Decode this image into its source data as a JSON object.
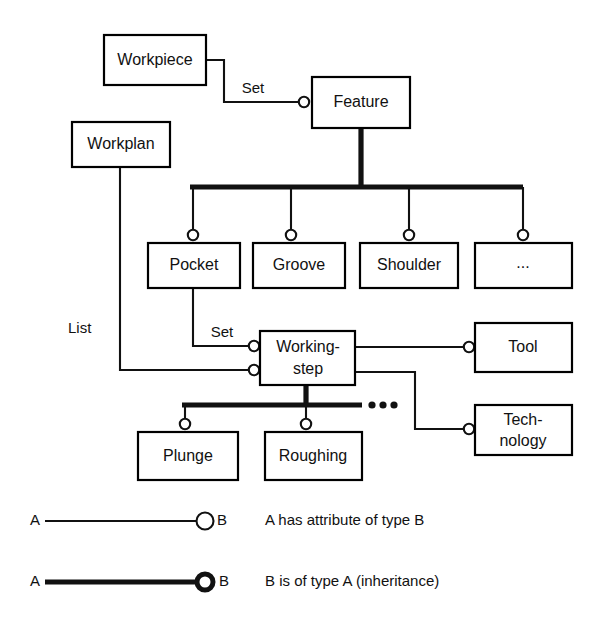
{
  "diagram": {
    "colors": {
      "line": "#111111",
      "box_fill": "#ffffff",
      "background": "#ffffff"
    },
    "nodes": [
      {
        "id": "workpiece",
        "label": "Workpiece",
        "x": 104,
        "y": 35,
        "w": 102,
        "h": 50
      },
      {
        "id": "feature",
        "label": "Feature",
        "x": 312,
        "y": 77,
        "w": 98,
        "h": 51
      },
      {
        "id": "workplan",
        "label": "Workplan",
        "x": 72,
        "y": 122,
        "w": 98,
        "h": 45
      },
      {
        "id": "pocket",
        "label": "Pocket",
        "x": 148,
        "y": 243,
        "w": 92,
        "h": 45
      },
      {
        "id": "groove",
        "label": "Groove",
        "x": 253,
        "y": 243,
        "w": 92,
        "h": 45
      },
      {
        "id": "shoulder",
        "label": "Shoulder",
        "x": 360,
        "y": 243,
        "w": 98,
        "h": 45
      },
      {
        "id": "more-feature",
        "label": "...",
        "x": 475,
        "y": 243,
        "w": 97,
        "h": 45
      },
      {
        "id": "workingstep",
        "label": "Working-step",
        "x": 260,
        "y": 331,
        "w": 95,
        "h": 54,
        "lines": [
          "Working-",
          "step"
        ]
      },
      {
        "id": "tool",
        "label": "Tool",
        "x": 475,
        "y": 323,
        "w": 97,
        "h": 49
      },
      {
        "id": "technology",
        "label": "Technology",
        "x": 475,
        "y": 405,
        "w": 97,
        "h": 50,
        "lines": [
          "Tech-",
          "nology"
        ]
      },
      {
        "id": "plunge",
        "label": "Plunge",
        "x": 138,
        "y": 432,
        "w": 100,
        "h": 48
      },
      {
        "id": "roughing",
        "label": "Roughing",
        "x": 265,
        "y": 432,
        "w": 97,
        "h": 48
      }
    ],
    "edge_labels": [
      {
        "id": "set-workpiece-feature",
        "text": "Set",
        "x": 253,
        "y": 89
      },
      {
        "id": "set-pocket-workingstep",
        "text": "Set",
        "x": 222,
        "y": 333
      },
      {
        "id": "list-workplan",
        "text": "List",
        "x": 68,
        "y": 329
      }
    ],
    "relations": [
      {
        "id": "workpiece-has-feature",
        "type": "attribute",
        "from": "Workpiece",
        "to": "Feature",
        "label": "Set"
      },
      {
        "id": "workplan-has-workingstep",
        "type": "attribute",
        "from": "Workplan",
        "to": "Working-step",
        "label": "List"
      },
      {
        "id": "pocket-has-workingstep",
        "type": "attribute",
        "from": "Pocket",
        "to": "Working-step",
        "label": "Set"
      },
      {
        "id": "workingstep-has-tool",
        "type": "attribute",
        "from": "Working-step",
        "to": "Tool",
        "label": ""
      },
      {
        "id": "workingstep-has-technology",
        "type": "attribute",
        "from": "Working-step",
        "to": "Technology",
        "label": ""
      },
      {
        "id": "feature-to-pocket",
        "type": "inheritance",
        "from": "Feature",
        "to": "Pocket",
        "label": ""
      },
      {
        "id": "feature-to-groove",
        "type": "inheritance",
        "from": "Feature",
        "to": "Groove",
        "label": ""
      },
      {
        "id": "feature-to-shoulder",
        "type": "inheritance",
        "from": "Feature",
        "to": "Shoulder",
        "label": ""
      },
      {
        "id": "feature-to-more",
        "type": "inheritance",
        "from": "Feature",
        "to": "...",
        "label": ""
      },
      {
        "id": "workingstep-to-plunge",
        "type": "inheritance",
        "from": "Working-step",
        "to": "Plunge",
        "label": ""
      },
      {
        "id": "workingstep-to-roughing",
        "type": "inheritance",
        "from": "Working-step",
        "to": "Roughing",
        "label": ""
      }
    ],
    "ellipsis": {
      "id": "workingstep-more",
      "text": "...",
      "x": 382,
      "y": 405
    }
  },
  "legend": {
    "rows": [
      {
        "id": "attribute",
        "left_label": "A",
        "right_label": "B",
        "description": "A has attribute of type B",
        "line_style": "thin",
        "y": 521
      },
      {
        "id": "inheritance",
        "left_label": "A",
        "right_label": "B",
        "description": "B is of type A (inheritance)",
        "line_style": "thick",
        "y": 582
      }
    ]
  }
}
